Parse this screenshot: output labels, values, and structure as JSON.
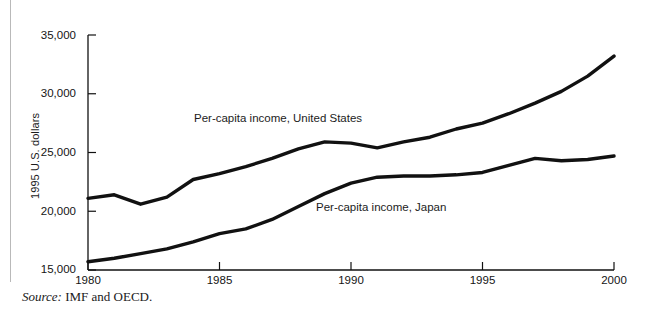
{
  "figure": {
    "source_prefix": "Source:",
    "source_text": " IMF and OECD.",
    "axis_y_title": "1995 U.S. dollars",
    "line_color": "#111111"
  },
  "chart_data": {
    "type": "line",
    "title": "",
    "subtitle": "",
    "xlabel": "",
    "ylabel": "1995 U.S. dollars",
    "xlim": [
      1980,
      2000
    ],
    "ylim": [
      15000,
      35000
    ],
    "ytick_labels": [
      "15,000",
      "20,000",
      "25,000",
      "30,000",
      "35,000"
    ],
    "ytick_values": [
      15000,
      20000,
      25000,
      30000,
      35000
    ],
    "xtick_labels": [
      "1980",
      "1985",
      "1990",
      "1995",
      "2000"
    ],
    "xtick_values": [
      1980,
      1985,
      1990,
      1995,
      2000
    ],
    "grid": false,
    "legend_position": "inline-annotation",
    "annotations": [
      {
        "text": "Per-capita income, United States",
        "x": 1984.2,
        "y": 27600
      },
      {
        "text": "Per-capita income, Japan",
        "x": 1988.5,
        "y": 20400
      }
    ],
    "x": [
      1980,
      1981,
      1982,
      1983,
      1984,
      1985,
      1986,
      1987,
      1988,
      1989,
      1990,
      1991,
      1992,
      1993,
      1994,
      1995,
      1996,
      1997,
      1998,
      1999,
      2000
    ],
    "series": [
      {
        "name": "Per-capita income, United States",
        "values": [
          21100,
          21400,
          20600,
          21200,
          22700,
          23200,
          23800,
          24500,
          25300,
          25900,
          25800,
          25400,
          25900,
          26300,
          27000,
          27500,
          28300,
          29200,
          30200,
          31500,
          33200
        ]
      },
      {
        "name": "Per-capita income, Japan",
        "values": [
          15700,
          16000,
          16400,
          16800,
          17400,
          18100,
          18500,
          19300,
          20400,
          21500,
          22400,
          22900,
          23000,
          23000,
          23100,
          23300,
          23900,
          24500,
          24300,
          24400,
          24700
        ]
      }
    ]
  }
}
